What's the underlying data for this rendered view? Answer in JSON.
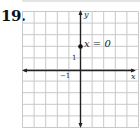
{
  "problem": {
    "number": "19."
  },
  "chart_data": {
    "type": "scatter",
    "title": "",
    "xlabel": "x",
    "ylabel": "y",
    "xlim": [
      -5,
      5
    ],
    "ylim": [
      -5,
      5
    ],
    "grid": true,
    "tick_labels": {
      "x": [
        "-1"
      ],
      "y": [
        "1"
      ]
    },
    "points": [
      {
        "x": 0,
        "y": 2
      }
    ],
    "annotations": [
      {
        "text": "x = 0",
        "x": 0,
        "y": 2
      }
    ],
    "legend": null
  },
  "labels": {
    "x_axis": "x",
    "y_axis": "y",
    "tick_neg1": "−1",
    "tick_1": "1",
    "annotation": "x = 0"
  },
  "colors": {
    "grid": "#c8c8c8",
    "axis": "#222222",
    "point": "#111111"
  }
}
